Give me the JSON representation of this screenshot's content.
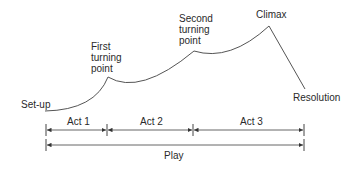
{
  "diagram": {
    "curve_points": {
      "setup": "Set-up",
      "first_turning_point": "First\nturning\npoint",
      "second_turning_point": "Second\nturning\npoint",
      "climax": "Climax",
      "resolution": "Resolution"
    },
    "acts": [
      {
        "label": "Act 1"
      },
      {
        "label": "Act 2"
      },
      {
        "label": "Act 3"
      }
    ],
    "span_label": "Play",
    "line_color": "#555555"
  }
}
